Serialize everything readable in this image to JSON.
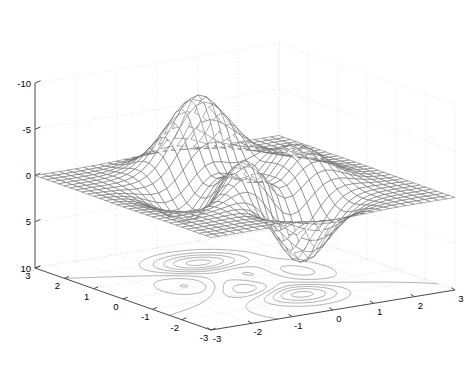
{
  "figure": {
    "title": "",
    "background_color": "#ffffff",
    "width": 472,
    "height": 369
  },
  "chart_data": {
    "type": "surface",
    "subtype": "mesh-with-contour (MATLAB meshc)",
    "title": "",
    "function": "peaks",
    "formula": "z = 3*(1-x)^2*exp(-x^2-(y+1)^2) - 10*(x/5 - x^3 - y^5)*exp(-x^2-y^2) - 1/3*exp(-(x+1)^2-y^2)",
    "xlabel": "",
    "ylabel": "",
    "zlabel": "",
    "xlim": [
      -3,
      3
    ],
    "ylim": [
      -3,
      3
    ],
    "zlim": [
      -10,
      10
    ],
    "grid_n": 31,
    "xticks": [
      -3,
      -2,
      -1,
      0,
      1,
      2,
      3
    ],
    "yticks": [
      -3,
      -2,
      -1,
      0,
      1,
      2,
      3
    ],
    "zticks": [
      -10,
      -5,
      0,
      5,
      10
    ],
    "xticklabels": [
      "-3",
      "-2",
      "-1",
      "0",
      "1",
      "2",
      "3"
    ],
    "yticklabels": [
      "3",
      "2",
      "1",
      "0",
      "-1",
      "-2",
      "-3"
    ],
    "zticklabels": [
      "10",
      "5",
      "0",
      "-5",
      "-10"
    ],
    "grid": true,
    "grid_style": "dotted",
    "grid_color": "#d8d8d8",
    "box": true,
    "legend": null,
    "view_azimuth": -37.5,
    "view_elevation": 30,
    "mesh_color": "#6a6a6a",
    "contour_color": "#808080",
    "axis_color": "#4d4d4d",
    "contour_levels": [
      -6,
      -4.5,
      -3,
      -1.5,
      0,
      1.5,
      3,
      4.5,
      6,
      7.5
    ],
    "contour_plane_z": -10,
    "extrema": {
      "max_value": 8.1,
      "max_at": [
        -0.01,
        1.58
      ],
      "min_value": -6.55,
      "min_at": [
        0.23,
        -1.63
      ]
    }
  },
  "axes": {
    "z_axis_name": "z-axis",
    "x_axis_name": "x-axis",
    "y_axis_name": "y-axis"
  }
}
